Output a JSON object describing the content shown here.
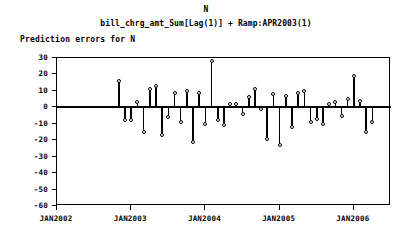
{
  "header": {
    "title": "N",
    "subtitle": "bill_chrg_amt_Sum[Lag(1)] + Ramp:APR2003(1)",
    "series_label": "Prediction errors for N"
  },
  "chart_data": {
    "type": "bar",
    "subtype": "needle-stem-plot",
    "title": "N",
    "subtitle": "bill_chrg_amt_Sum[Lag(1)] + Ramp:APR2003(1)",
    "series_name": "Prediction errors for N",
    "xlabel": "",
    "ylabel": "",
    "ylim": [
      -60,
      30
    ],
    "yticks": [
      30,
      20,
      10,
      0,
      -10,
      -20,
      -30,
      -40,
      -50,
      -60
    ],
    "ytick_labels": [
      "30",
      "20",
      "10",
      "0",
      "-10",
      "-20",
      "-30",
      "-40",
      "-50",
      "-60"
    ],
    "xlim": [
      "JAN2002",
      "JUL2006"
    ],
    "xticks": [
      "JAN2002",
      "JAN2003",
      "JAN2004",
      "JAN2005",
      "JAN2006"
    ],
    "grid": false,
    "legend": "none",
    "zero_reference_line": 0,
    "marker": "open-circle",
    "x": [
      "NOV2002",
      "DEC2002",
      "JAN2003",
      "FEB2003",
      "MAR2003",
      "APR2003",
      "MAY2003",
      "JUN2003",
      "JUL2003",
      "AUG2003",
      "SEP2003",
      "OCT2003",
      "NOV2003",
      "DEC2003",
      "JAN2004",
      "FEB2004",
      "MAR2004",
      "APR2004",
      "MAY2004",
      "JUN2004",
      "JUL2004",
      "AUG2004",
      "SEP2004",
      "OCT2004",
      "NOV2004",
      "DEC2004",
      "JAN2005",
      "FEB2005",
      "MAR2005",
      "APR2005",
      "MAY2005",
      "JUN2005",
      "JUL2005",
      "AUG2005",
      "SEP2005",
      "OCT2005",
      "NOV2005",
      "DEC2005",
      "JAN2006",
      "FEB2006",
      "MAR2006",
      "APR2006"
    ],
    "values": [
      16,
      -8,
      -8,
      3,
      -15,
      11,
      13,
      -17,
      -6,
      9,
      -9,
      10,
      -21,
      9,
      -10,
      28,
      -8,
      -11,
      2,
      2,
      -4,
      6,
      11,
      -1,
      -19,
      8,
      -23,
      7,
      -12,
      9,
      10,
      -9,
      -7,
      -10,
      2,
      3,
      -5,
      5,
      19,
      4,
      -15,
      -9
    ],
    "ymax_observed": 28,
    "ymin_observed": -23
  }
}
